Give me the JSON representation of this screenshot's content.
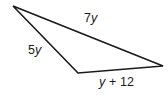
{
  "figure": {
    "type": "triangle",
    "background_color": "#ffffff",
    "stroke_color": "#1a1a1a",
    "stroke_width": 1.6,
    "vertices": [
      {
        "name": "top-left-vertex",
        "x": 13,
        "y": 6
      },
      {
        "name": "right-vertex",
        "x": 163,
        "y": 66
      },
      {
        "name": "bottom-left-vertex",
        "x": 78,
        "y": 73
      }
    ],
    "path": "M 13 6 L 163 66 L 78 73 Z"
  },
  "labels": {
    "top_side": {
      "name": "side-label-7y",
      "text": "7y",
      "coefficient": "7",
      "variable": "y",
      "between_vertices": "top-left-vertex to right-vertex"
    },
    "left_side": {
      "name": "side-label-5y",
      "text": "5y",
      "coefficient": "5",
      "variable": "y",
      "between_vertices": "top-left-vertex to bottom-left-vertex"
    },
    "bottom_side": {
      "name": "side-label-y-plus-12",
      "text": "y + 12",
      "variable": "y",
      "operator": "+",
      "constant": "12",
      "between_vertices": "bottom-left-vertex to right-vertex"
    }
  }
}
